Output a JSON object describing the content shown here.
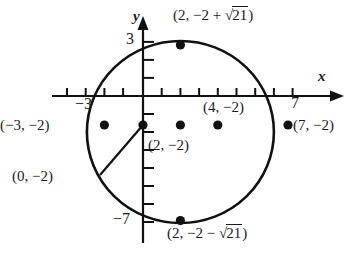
{
  "figure": {
    "axes": {
      "x_label": "x",
      "y_label": "y",
      "x_ticks_labeled": [
        {
          "value": -3,
          "text": "−3"
        },
        {
          "value": 7,
          "text": "7"
        }
      ],
      "y_ticks_labeled": [
        {
          "value": 3,
          "text": "3"
        },
        {
          "value": -7,
          "text": "−7"
        }
      ],
      "x_tick_values": [
        -3,
        -2,
        -1,
        0,
        1,
        2,
        3,
        4,
        5,
        6,
        7
      ],
      "y_tick_values": [
        3,
        2,
        1,
        0,
        -1,
        -2,
        -3,
        -4,
        -5,
        -6,
        -7
      ],
      "x_range": [
        -4.2,
        8.4
      ],
      "y_range": [
        4.0,
        -8.0
      ],
      "origin_px": [
        143,
        96
      ],
      "unit_px": 18.7,
      "grid": false
    },
    "circle": {
      "center": [
        2,
        -2
      ],
      "radius": 5,
      "stroke": "#111111",
      "fill": "none"
    },
    "points": [
      {
        "id": "left-intercept",
        "coords": [
          -3,
          -2
        ],
        "label": "(−3, −2)",
        "label_pos": "left"
      },
      {
        "id": "y-axis-point",
        "coords": [
          0,
          -2
        ],
        "label": "(0, −2)",
        "label_pos": "leader-lower-left"
      },
      {
        "id": "center-point",
        "coords": [
          2,
          -2
        ],
        "label": "(2, −2)",
        "label_pos": "below-right"
      },
      {
        "id": "interior-point",
        "coords": [
          4,
          -2
        ],
        "label": "(4, −2)",
        "label_pos": "above"
      },
      {
        "id": "right-intercept",
        "coords": [
          7,
          -2
        ],
        "label": "(7, −2)",
        "label_pos": "right"
      },
      {
        "id": "top-point",
        "coords": [
          2,
          2.583
        ],
        "label": "(2, −2 + √21)",
        "label_pos": "above-right"
      },
      {
        "id": "bottom-point",
        "coords": [
          2,
          -6.583
        ],
        "label": "(2, −2 − √21)",
        "label_pos": "below-right"
      }
    ],
    "labels": {
      "top_point_prefix": "(2, −2 + ",
      "top_point_radicand": "21",
      "top_point_suffix": ")",
      "bottom_point_prefix": "(2, −2 − ",
      "bottom_point_radicand": "21",
      "bottom_point_suffix": ")",
      "left_intercept": "(−3, −2)",
      "right_intercept": "(7, −2)",
      "y_axis_point": "(0, −2)",
      "center_point": "(2, −2)",
      "interior_point": "(4, −2)",
      "tick_neg3": "−3",
      "tick_7": "7",
      "tick_3": "3",
      "tick_neg7": "−7",
      "axis_x": "x",
      "axis_y": "y"
    }
  }
}
